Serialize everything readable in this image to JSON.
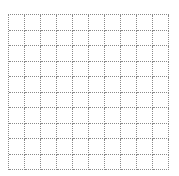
{
  "grid": {
    "rows": 10,
    "columns": 10,
    "line_style": "dotted",
    "line_color": "#8a8a8a",
    "background": "#ffffff"
  }
}
